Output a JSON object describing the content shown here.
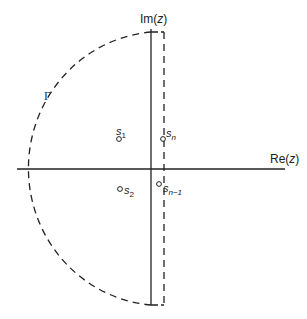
{
  "diagram": {
    "axes": {
      "imaginary": {
        "label_prefix": "Im(",
        "label_var": "z",
        "label_suffix": ")"
      },
      "real": {
        "label_prefix": "Re(",
        "label_var": "z",
        "label_suffix": ")"
      }
    },
    "contour": {
      "label": "Γ",
      "style": "dashed",
      "shape": "left semicircle closed by vertical dashed line right of imaginary axis"
    },
    "points": [
      {
        "name": "s",
        "sub": "1",
        "position": "upper-left of Im axis"
      },
      {
        "name": "s",
        "sub": "n",
        "position": "upper, on dashed line"
      },
      {
        "name": "s",
        "sub": "2",
        "position": "lower-left of Im axis"
      },
      {
        "name": "s",
        "sub": "n−1",
        "position": "lower, on dashed line"
      }
    ],
    "colors": {
      "line": "#222222",
      "background": "#ffffff"
    }
  }
}
